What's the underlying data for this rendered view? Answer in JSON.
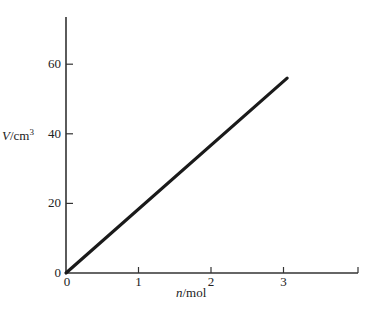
{
  "chart_data": {
    "type": "line",
    "title": "",
    "xlabel": "n/mol",
    "ylabel": "V/cm³",
    "xlabel_parts": {
      "var": "n",
      "unit": "/mol"
    },
    "ylabel_parts": {
      "var": "V",
      "unit": "/cm",
      "sup": "3"
    },
    "xlim": [
      0,
      4
    ],
    "ylim": [
      0,
      72
    ],
    "xticks": [
      0,
      1,
      2,
      3
    ],
    "yticks": [
      0,
      20,
      40,
      60
    ],
    "grid": false,
    "legend": null,
    "series": [
      {
        "name": "V vs n",
        "x": [
          0,
          3.05
        ],
        "y": [
          0,
          56
        ],
        "color": "#1a1a1a"
      }
    ]
  },
  "style": {
    "axis_color": "#333333",
    "line_color": "#1a1a1a"
  }
}
